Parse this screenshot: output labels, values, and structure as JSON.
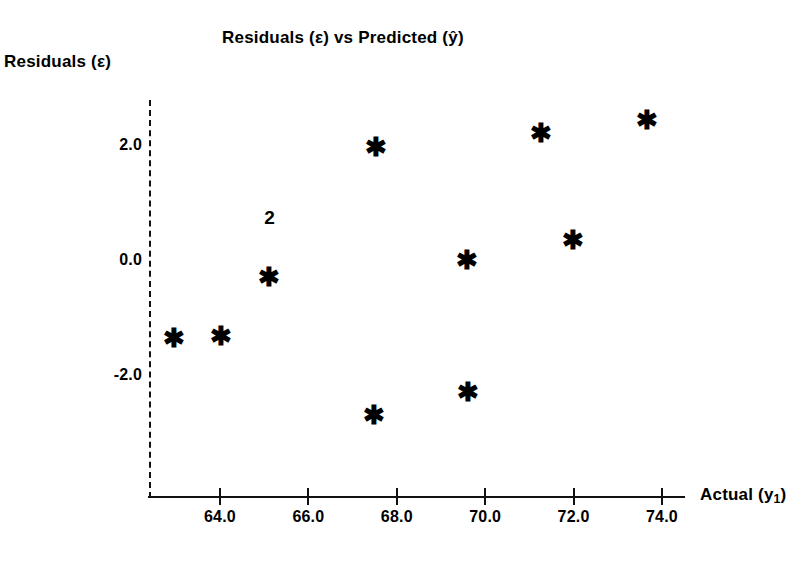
{
  "chart_data": {
    "type": "scatter",
    "title": "Residuals (ε) vs Predicted (ŷ)",
    "xlabel": "Actual (y₁)",
    "ylabel": "Residuals (ε)",
    "xlabel_main": "Actual (y",
    "xlabel_sub": "1",
    "xlabel_tail": ")",
    "grid": false,
    "legend": "none",
    "xlim": [
      62.3,
      74.8
    ],
    "ylim": [
      -3.4,
      3.1
    ],
    "xticks": [
      "64.0",
      "66.0",
      "68.0",
      "70.0",
      "72.0",
      "74.0"
    ],
    "xtick_values": [
      64.0,
      66.0,
      68.0,
      70.0,
      72.0,
      74.0
    ],
    "yticks": [
      "2.0",
      "0.0",
      "-2.0"
    ],
    "ytick_values": [
      2.0,
      0.0,
      -2.0
    ],
    "marker": "asterisk",
    "marker_glyph": "✱",
    "marker_color": "#000000",
    "points": [
      {
        "x": 62.95,
        "y": -1.35,
        "label": ""
      },
      {
        "x": 64.02,
        "y": -1.33,
        "label": ""
      },
      {
        "x": 65.1,
        "y": -0.3,
        "label": ""
      },
      {
        "x": 65.12,
        "y": 0.75,
        "label": "2"
      },
      {
        "x": 67.53,
        "y": 1.97,
        "label": ""
      },
      {
        "x": 67.48,
        "y": -2.7,
        "label": ""
      },
      {
        "x": 69.59,
        "y": 0.0,
        "label": ""
      },
      {
        "x": 69.61,
        "y": -2.29,
        "label": ""
      },
      {
        "x": 71.27,
        "y": 2.21,
        "label": ""
      },
      {
        "x": 71.99,
        "y": 0.35,
        "label": ""
      },
      {
        "x": 73.66,
        "y": 2.43,
        "label": ""
      }
    ],
    "overplot_note": "The numeral 2 marks two coincident observations."
  }
}
